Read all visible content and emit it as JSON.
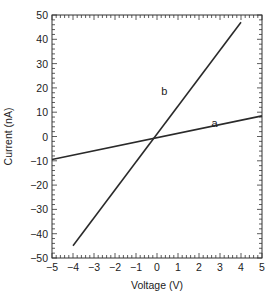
{
  "chart_data": {
    "type": "line",
    "title": "",
    "xlabel": "Voltage (V)",
    "ylabel": "Current (nA)",
    "xlim": [
      -5,
      5
    ],
    "ylim": [
      -50,
      50
    ],
    "xticks": [
      -5,
      -4,
      -3,
      -2,
      -1,
      0,
      1,
      2,
      3,
      4,
      5
    ],
    "yticks": [
      50,
      40,
      30,
      20,
      10,
      0,
      -10,
      -20,
      -30,
      -40,
      -50
    ],
    "xtick_labels": [
      "−5",
      "−4",
      "−3",
      "−2",
      "−1",
      "0",
      "1",
      "2",
      "3",
      "4",
      "5"
    ],
    "ytick_labels": [
      "50",
      "40",
      "30",
      "20",
      "10",
      "0",
      "−10",
      "−20",
      "−30",
      "−40",
      "−50"
    ],
    "grid": false,
    "legend": "none (inline labels)",
    "series": [
      {
        "name": "a",
        "x": [
          -5,
          5
        ],
        "y": [
          -9.5,
          8.5
        ],
        "label_pos": [
          2.6,
          4
        ]
      },
      {
        "name": "b",
        "x": [
          -4,
          4
        ],
        "y": [
          -45,
          47
        ],
        "label_pos": [
          0.2,
          17
        ]
      }
    ]
  }
}
